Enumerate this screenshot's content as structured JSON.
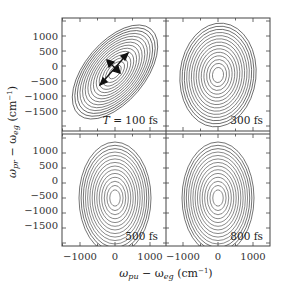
{
  "chart_data": {
    "type": "contour",
    "layout": "2x2 grid of 2D spectra sharing axes",
    "xlabel": "ω_pu − ω_eg (cm⁻¹)",
    "ylabel": "ω_pr − ω_eg (cm⁻¹)",
    "xlim": [
      -1700,
      1700
    ],
    "ylim": [
      -2000,
      1500
    ],
    "x_ticks": [
      -1000,
      0,
      1000
    ],
    "x_tick_labels": [
      "−1000",
      "0",
      "1000"
    ],
    "y_ticks": [
      1000,
      500,
      0,
      -500,
      -1000,
      -1500
    ],
    "y_tick_labels": [
      "1000",
      "500",
      "0",
      "−500",
      "−1000",
      "−1500"
    ],
    "grid": false,
    "legend": "none",
    "panels": [
      {
        "label": "T = 100 fs",
        "label_italic_var": "T",
        "label_rest": " = 100 fs",
        "position": "top-left",
        "center": [
          0,
          -200
        ],
        "tilt_deg": 50,
        "shape": "diagonally elongated ellipse",
        "arrows": "two orthogonal double arrows (diagonal and anti-diagonal)",
        "n_contours": 14
      },
      {
        "label": "300 fs",
        "position": "top-right",
        "center": [
          0,
          -300
        ],
        "tilt_deg": 80,
        "shape": "nearly vertical ellipse",
        "n_contours": 14
      },
      {
        "label": "500 fs",
        "position": "bottom-left",
        "center": [
          0,
          -500
        ],
        "tilt_deg": 90,
        "shape": "vertical ellipse",
        "n_contours": 14
      },
      {
        "label": "800 fs",
        "position": "bottom-right",
        "center": [
          0,
          -500
        ],
        "tilt_deg": 90,
        "shape": "vertical ellipse",
        "n_contours": 14
      }
    ]
  },
  "axes": {
    "x_title_main": "ω",
    "x_title_sub1": "pu",
    "x_title_minus": " − ω",
    "x_title_sub2": "eg",
    "x_title_unit": " (cm",
    "x_title_exp": "−1",
    "x_title_close": ")",
    "y_title_main": "ω",
    "y_title_sub1": "pr",
    "y_title_minus": " − ω",
    "y_title_sub2": "eg",
    "y_title_unit": " (cm",
    "y_title_exp": "−1",
    "y_title_close": ")"
  }
}
